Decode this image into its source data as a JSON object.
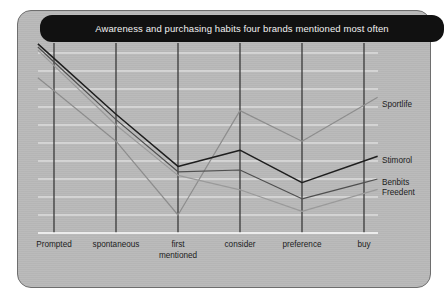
{
  "card": {
    "background_color": "#b9b9b9",
    "border_color": "#6e6e6e"
  },
  "title": {
    "text": "Awareness and purchasing habits four brands mentioned most often",
    "background_color": "#111111",
    "text_color": "#f2f2f2"
  },
  "chart_data": {
    "type": "line",
    "title": "Awareness and purchasing habits four brands mentioned most often",
    "xlabel": "",
    "ylabel": "",
    "categories": [
      "Prompted",
      "spontaneous",
      "first mentioned",
      "consider",
      "preference",
      "buy"
    ],
    "ylim": [
      0,
      100
    ],
    "grid": true,
    "gridlines_horizontal": 11,
    "gridlines_vertical": 6,
    "legend_position": "right-inline",
    "series": [
      {
        "name": "Sportlife",
        "color": "#8d8d8d",
        "values": [
          79,
          51,
          10,
          68,
          51,
          71
        ]
      },
      {
        "name": "Stimorol",
        "color": "#1e1e1e",
        "values": [
          97,
          66,
          37,
          46,
          28,
          40
        ]
      },
      {
        "name": "Benbits",
        "color": "#4f4f4f",
        "values": [
          95,
          63,
          34,
          35,
          19,
          28
        ]
      },
      {
        "name": "Freedent",
        "color": "#9a9a9a",
        "values": [
          93,
          60,
          32,
          24,
          12,
          22
        ]
      }
    ]
  },
  "axis": {
    "x_tick_labels": [
      {
        "line1": "Prompted",
        "line2": ""
      },
      {
        "line1": "spontaneous",
        "line2": ""
      },
      {
        "line1": "first",
        "line2": "mentioned"
      },
      {
        "line1": "consider",
        "line2": ""
      },
      {
        "line1": "preference",
        "line2": ""
      },
      {
        "line1": "buy",
        "line2": ""
      }
    ]
  },
  "legend": {
    "items": [
      {
        "label": "Sportlife"
      },
      {
        "label": "Stimorol"
      },
      {
        "label": "Benbits"
      },
      {
        "label": "Freedent"
      }
    ]
  }
}
